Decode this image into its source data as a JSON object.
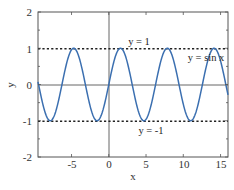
{
  "chart_data": {
    "type": "line",
    "title": "",
    "xlabel": "x",
    "ylabel": "y",
    "xlim": [
      -9.5,
      16
    ],
    "ylim": [
      -2,
      2
    ],
    "xticks": [
      -5,
      0,
      5,
      10,
      15
    ],
    "yticks": [
      -2,
      -1,
      0,
      1,
      2
    ],
    "grid": false,
    "series": [
      {
        "name": "y = sin x",
        "function": "sin(x)",
        "color": "#3b6fb0",
        "style": "solid"
      },
      {
        "name": "y = 1",
        "function": "1",
        "color": "#222222",
        "style": "dotted"
      },
      {
        "name": "y = -1",
        "function": "-1",
        "color": "#222222",
        "style": "dotted"
      }
    ],
    "reference_lines": [
      {
        "axis": "x",
        "value": 0
      },
      {
        "axis": "y",
        "value": 0
      }
    ],
    "annotations": [
      {
        "text": "y = 1",
        "x": 3.8,
        "y": 1.1
      },
      {
        "text": "y = sin x",
        "x": 12.8,
        "y": 0.75
      },
      {
        "text": "y = -1",
        "x": 5.6,
        "y": -1.25
      }
    ]
  },
  "labels": {
    "xlabel": "x",
    "ylabel": "y",
    "xticks": [
      "-5",
      "0",
      "5",
      "10",
      "15"
    ],
    "yticks": [
      "2",
      "1",
      "0",
      "-1",
      "-2"
    ],
    "annot_y1": "y = 1",
    "annot_sin": "y = sin x",
    "annot_ym1": "y = -1"
  }
}
